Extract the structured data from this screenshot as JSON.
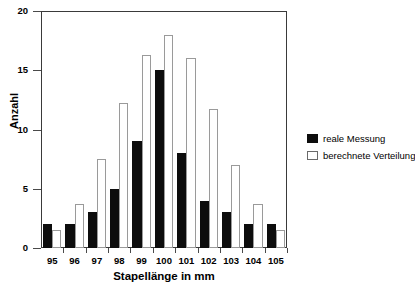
{
  "chart_data": {
    "type": "bar",
    "title": "",
    "xlabel": "Stapellänge in mm",
    "ylabel": "Anzahl",
    "categories": [
      "95",
      "96",
      "97",
      "98",
      "99",
      "100",
      "101",
      "102",
      "103",
      "104",
      "105"
    ],
    "series": [
      {
        "name": "reale Messung",
        "color": "#0d0d0d",
        "values": [
          2,
          2,
          3,
          5,
          9,
          15,
          8,
          4,
          3,
          2,
          2
        ]
      },
      {
        "name": "berechnete Verteilung",
        "color": "#ffffff",
        "values": [
          1.5,
          3.7,
          7.5,
          12.2,
          16.3,
          18,
          16,
          11.7,
          7,
          3.7,
          1.5
        ]
      }
    ],
    "ylim": [
      0,
      20
    ],
    "yticks": [
      0,
      5,
      10,
      15,
      20
    ],
    "ytick_labels": [
      "0",
      "5",
      "10",
      "15",
      "20"
    ],
    "grid": false,
    "legend_position": "right"
  },
  "legend": {
    "items": [
      {
        "label": "reale Messung",
        "style": "filled-black"
      },
      {
        "label": "berechnete Verteilung",
        "style": "outlined-white"
      }
    ]
  }
}
